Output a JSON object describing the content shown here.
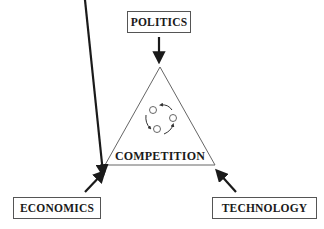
{
  "diagram": {
    "top_node": {
      "label": "POLITICS"
    },
    "left_node": {
      "label": "ECONOMICS"
    },
    "right_node": {
      "label": "TECHNOLOGY"
    },
    "center": {
      "label": "COMPETITION",
      "shape": "triangle",
      "icon": "cycle-icon"
    },
    "arrows": [
      {
        "from": "POLITICS",
        "to": "COMPETITION"
      },
      {
        "from": "ECONOMICS",
        "to": "COMPETITION"
      },
      {
        "from": "TECHNOLOGY",
        "to": "COMPETITION"
      }
    ],
    "colors": {
      "stroke": "#555555",
      "arrow": "#1a1a1a",
      "text": "#1a1a1a",
      "background": "#ffffff"
    }
  }
}
